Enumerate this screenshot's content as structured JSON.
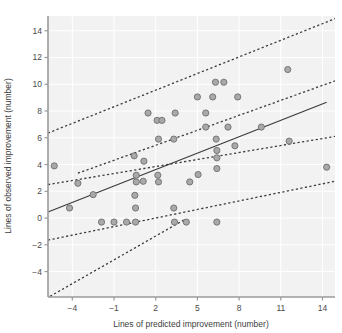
{
  "chart_data": {
    "type": "scatter",
    "title": "",
    "xlabel": "Lines of predicted improvement (number)",
    "ylabel": "Lines of observed improvement (number)",
    "xlim": [
      -5.75,
      14.9
    ],
    "ylim": [
      -5.9,
      15.1
    ],
    "xticks": [
      -4,
      -1,
      2,
      5,
      8,
      11,
      14
    ],
    "xticklabels": [
      "-4",
      "-1",
      "2",
      "5",
      "8",
      "11",
      "14"
    ],
    "yticks": [
      -4,
      -2,
      0,
      2,
      4,
      6,
      8,
      10,
      12,
      14
    ],
    "yticklabels": [
      "-4",
      "-2",
      "0",
      "2",
      "4",
      "6",
      "8",
      "10",
      "12",
      "14"
    ],
    "grid": true,
    "grid_color": "#ffffff",
    "plot_bgcolor": "#f2f2f2",
    "legend": "none",
    "marker": {
      "shape": "circle",
      "fill_color": "#a9a9a9",
      "edge_color": "#6e6e6e",
      "size_px": 6.2
    },
    "points": [
      {
        "x": -5.3,
        "y": 3.9
      },
      {
        "x": -4.2,
        "y": 0.75
      },
      {
        "x": -3.6,
        "y": 2.6
      },
      {
        "x": -2.5,
        "y": 1.75
      },
      {
        "x": -1.9,
        "y": -0.3
      },
      {
        "x": -1.0,
        "y": -0.3
      },
      {
        "x": -0.1,
        "y": -0.3
      },
      {
        "x": 0.55,
        "y": -0.3
      },
      {
        "x": 0.55,
        "y": 0.75
      },
      {
        "x": 0.5,
        "y": 1.7
      },
      {
        "x": 0.6,
        "y": 2.7
      },
      {
        "x": 0.6,
        "y": 3.2
      },
      {
        "x": 0.45,
        "y": 4.65
      },
      {
        "x": 1.1,
        "y": 2.75
      },
      {
        "x": 1.15,
        "y": 4.25
      },
      {
        "x": 1.45,
        "y": 7.85
      },
      {
        "x": 2.1,
        "y": 7.3
      },
      {
        "x": 2.15,
        "y": 3.2
      },
      {
        "x": 2.2,
        "y": 2.7
      },
      {
        "x": 2.45,
        "y": 7.3
      },
      {
        "x": 2.2,
        "y": 5.9
      },
      {
        "x": 3.3,
        "y": 5.9
      },
      {
        "x": 3.4,
        "y": 7.85
      },
      {
        "x": 3.3,
        "y": 0.75
      },
      {
        "x": 3.35,
        "y": -0.3
      },
      {
        "x": 4.2,
        "y": -0.3
      },
      {
        "x": 4.45,
        "y": 2.7
      },
      {
        "x": 5.0,
        "y": 9.05
      },
      {
        "x": 5.05,
        "y": 3.25
      },
      {
        "x": 5.6,
        "y": 6.8
      },
      {
        "x": 5.6,
        "y": 7.85
      },
      {
        "x": 6.1,
        "y": 9.05
      },
      {
        "x": 6.3,
        "y": 10.15
      },
      {
        "x": 6.35,
        "y": 5.9
      },
      {
        "x": 6.4,
        "y": 5.05
      },
      {
        "x": 6.4,
        "y": 4.5
      },
      {
        "x": 6.4,
        "y": 3.7
      },
      {
        "x": 6.4,
        "y": -0.3
      },
      {
        "x": 6.9,
        "y": 10.15
      },
      {
        "x": 7.2,
        "y": 6.8
      },
      {
        "x": 7.7,
        "y": 5.4
      },
      {
        "x": 7.9,
        "y": 9.05
      },
      {
        "x": 9.6,
        "y": 6.8
      },
      {
        "x": 11.5,
        "y": 11.1
      },
      {
        "x": 11.6,
        "y": 5.75
      },
      {
        "x": 14.3,
        "y": 3.8
      }
    ],
    "fit_line": {
      "style": "solid",
      "color": "#3b3b3b",
      "x0": -5.75,
      "y0": 0.45,
      "x1": 14.3,
      "y1": 8.65
    },
    "bands": [
      {
        "name": "upper-prediction-band",
        "style": "dashed",
        "color": "#3b3b3b",
        "x0": -5.75,
        "y0": 6.35,
        "x1": 14.9,
        "y1": 14.9
      },
      {
        "name": "upper-confidence-band",
        "style": "dashed",
        "color": "#3b3b3b",
        "x0": -3.6,
        "y0": 3.35,
        "x1": 14.9,
        "y1": 10.25
      },
      {
        "name": "lower-confidence-band",
        "style": "dashed",
        "color": "#3b3b3b",
        "x0": -5.75,
        "y0": 2.5,
        "x1": 14.9,
        "y1": 6.1
      },
      {
        "name": "lower-prediction-band",
        "style": "dashed",
        "color": "#3b3b3b",
        "x0": -5.75,
        "y0": -1.65,
        "x1": 14.9,
        "y1": 2.75
      },
      {
        "name": "lowest-band",
        "style": "dashed",
        "color": "#3b3b3b",
        "x0": -5.6,
        "y0": -5.85,
        "x1": 4.1,
        "y1": -0.1
      }
    ]
  }
}
